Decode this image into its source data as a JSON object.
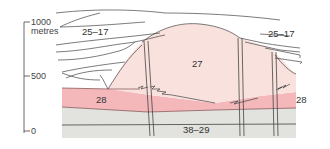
{
  "figure": {
    "type": "geological-cross-section",
    "colors": {
      "dome": "#f9e2dd",
      "layer_28": "#f4b8bb",
      "basement": "#e2e2df",
      "lines": "#333333",
      "background": "#ffffff"
    },
    "axis": {
      "unit_label": "metres",
      "ticks": [
        {
          "value": "1000",
          "label": "1000"
        },
        {
          "value": "500",
          "label": "500"
        },
        {
          "value": "0",
          "label": "0"
        }
      ]
    },
    "labels": {
      "upper_left": "25–17",
      "upper_right": "25–17",
      "dome": "27",
      "layer_left": "28",
      "layer_right": "28",
      "basement": "38–29"
    }
  }
}
